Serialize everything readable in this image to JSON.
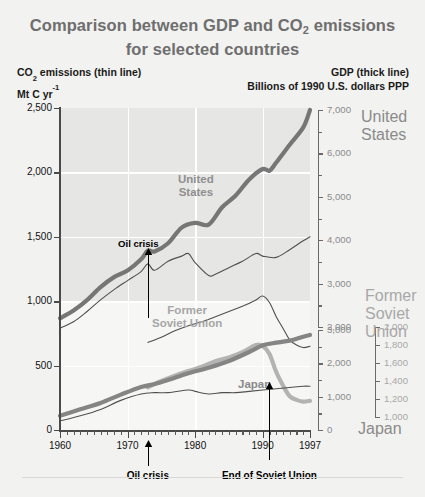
{
  "header": {
    "title_line1": "Comparison between GDP and CO",
    "title_sub": "2",
    "title_line1b": " emissions",
    "title_line2": "for selected countries",
    "left_head_l1a": "CO",
    "left_head_sub": "2",
    "left_head_l1b": " emissions (thin line)",
    "left_head_l2a": "Mt C yr",
    "left_head_l2sup": "-1",
    "right_head_l1": "GDP (thick line)",
    "right_head_l2": "Billions of 1990 U.S. dollars PPP"
  },
  "colors": {
    "title": "#6e6e6e",
    "plot_bg": "#f6f6f4",
    "plot_band": "#e6e6e4",
    "grid": "#ffffff",
    "axis": "#4a4a4a",
    "united_states": "#767676",
    "former_soviet_union": "#b3b3b3",
    "japan": "#858585",
    "thin_line": "#4f4f4f",
    "annotation": "#000000"
  },
  "chart_data": {
    "type": "line",
    "title": "Comparison between GDP and CO2 emissions for selected countries",
    "xlabel": "",
    "ylabel": "CO2 emissions (thin line) Mt C yr-1",
    "ylabel_right": "GDP (thick line) Billions of 1990 U.S. dollars PPP",
    "grid": true,
    "legend_position": "inline-annotations",
    "xlim": [
      1960,
      1997
    ],
    "x_ticks": [
      1960,
      1970,
      1980,
      1990,
      1997
    ],
    "x_minor_tick_interval": 1,
    "ylim_left": [
      0,
      2500
    ],
    "y_ticks_left": [
      0,
      500,
      1000,
      1500,
      2000,
      2500
    ],
    "y_tick_labels_left": [
      "0",
      "500",
      "1,000",
      "1,500",
      "2,000",
      "2,500"
    ],
    "right_axes": [
      {
        "name": "United States",
        "label": "United\nStates",
        "label_lines": [
          "United",
          "States"
        ],
        "ticks": [
          2000,
          3000,
          4000,
          5000,
          6000,
          7000
        ],
        "tick_labels": [
          "2,000",
          "3,000",
          "4,000",
          "5,000",
          "6,000",
          "7,000"
        ],
        "minor_tick_interval": 500,
        "range": [
          2000,
          7000
        ]
      },
      {
        "name": "Former Soviet Union",
        "label_lines": [
          "Former",
          "Soviet",
          "Union"
        ],
        "ticks": [
          1000,
          1200,
          1400,
          1600,
          1800,
          2000
        ],
        "tick_labels": [
          "1,000",
          "1,200",
          "1,400",
          "1,600",
          "1,800",
          "2,000"
        ],
        "range": [
          1000,
          2000
        ]
      },
      {
        "name": "Japan",
        "label_lines": [
          "Japan"
        ],
        "ticks": [
          0,
          1000,
          2000,
          3000
        ],
        "tick_labels": [
          "0",
          "1,000",
          "2,000",
          "3,000"
        ],
        "minor_tick_interval": 500,
        "range": [
          0,
          3000
        ]
      }
    ],
    "series": [
      {
        "name": "United States GDP",
        "country": "United States",
        "kind": "GDP",
        "style": "thick",
        "axis": "us-gdp",
        "unit": "Billions of 1990 U.S. dollars PPP",
        "x": [
          1960,
          1962,
          1964,
          1966,
          1968,
          1970,
          1972,
          1973,
          1974,
          1976,
          1978,
          1980,
          1982,
          1984,
          1986,
          1988,
          1990,
          1991,
          1992,
          1994,
          1996,
          1997
        ],
        "values": [
          2200,
          2380,
          2620,
          2920,
          3150,
          3300,
          3560,
          3760,
          3740,
          3930,
          4290,
          4400,
          4360,
          4760,
          5030,
          5400,
          5640,
          5600,
          5790,
          6200,
          6600,
          7000
        ]
      },
      {
        "name": "United States CO2",
        "country": "United States",
        "kind": "CO2",
        "style": "thin",
        "axis": "left",
        "unit": "Mt C yr-1",
        "x": [
          1960,
          1962,
          1964,
          1966,
          1968,
          1970,
          1972,
          1973,
          1974,
          1976,
          1978,
          1979,
          1980,
          1982,
          1983,
          1985,
          1987,
          1989,
          1990,
          1992,
          1994,
          1996,
          1997
        ],
        "values": [
          790,
          840,
          920,
          1010,
          1090,
          1160,
          1230,
          1290,
          1240,
          1310,
          1350,
          1370,
          1300,
          1200,
          1210,
          1260,
          1310,
          1370,
          1350,
          1340,
          1400,
          1470,
          1500
        ]
      },
      {
        "name": "Former Soviet Union GDP",
        "country": "Former Soviet Union",
        "kind": "GDP",
        "style": "thick",
        "axis": "fsu",
        "unit": "Billions of 1990 U.S. dollars PPP",
        "x": [
          1973,
          1975,
          1977,
          1979,
          1981,
          1983,
          1985,
          1987,
          1989,
          1990,
          1991,
          1992,
          1993,
          1994,
          1995,
          1996,
          1997
        ],
        "values": [
          1330,
          1400,
          1460,
          1510,
          1560,
          1620,
          1660,
          1720,
          1800,
          1790,
          1700,
          1500,
          1350,
          1230,
          1190,
          1170,
          1180
        ]
      },
      {
        "name": "Former Soviet Union CO2",
        "country": "Former Soviet Union",
        "kind": "CO2",
        "style": "thin",
        "axis": "left",
        "unit": "Mt C yr-1",
        "x": [
          1973,
          1975,
          1977,
          1979,
          1981,
          1983,
          1985,
          1987,
          1989,
          1990,
          1991,
          1992,
          1993,
          1994,
          1995,
          1996,
          1997
        ],
        "values": [
          680,
          720,
          770,
          810,
          840,
          880,
          920,
          960,
          1010,
          1040,
          990,
          880,
          790,
          700,
          660,
          640,
          650
        ]
      },
      {
        "name": "Japan GDP",
        "country": "Japan",
        "kind": "GDP",
        "style": "thick",
        "axis": "japan",
        "unit": "Billions of 1990 U.S. dollars PPP",
        "x": [
          1960,
          1963,
          1966,
          1969,
          1972,
          1974,
          1976,
          1979,
          1982,
          1985,
          1988,
          1990,
          1992,
          1994,
          1996,
          1997
        ],
        "values": [
          430,
          620,
          810,
          1060,
          1290,
          1380,
          1500,
          1700,
          1870,
          2070,
          2340,
          2540,
          2620,
          2680,
          2800,
          2850
        ]
      },
      {
        "name": "Japan CO2",
        "country": "Japan",
        "kind": "CO2",
        "style": "thin",
        "axis": "left",
        "unit": "Mt C yr-1",
        "x": [
          1960,
          1963,
          1966,
          1969,
          1972,
          1974,
          1976,
          1979,
          1980,
          1982,
          1984,
          1986,
          1988,
          1990,
          1992,
          1994,
          1996,
          1997
        ],
        "values": [
          70,
          110,
          160,
          230,
          280,
          290,
          290,
          310,
          300,
          280,
          290,
          290,
          300,
          310,
          320,
          330,
          340,
          340
        ]
      }
    ],
    "annotations": [
      {
        "label": "Oil crisis",
        "x": 1973,
        "placement": "in-plot",
        "has_arrow": true
      },
      {
        "label": "Oil crisis",
        "x": 1973,
        "placement": "below-axis",
        "has_arrow": true
      },
      {
        "label": "End of Soviet Union",
        "x": 1991,
        "placement": "below-axis",
        "has_arrow": true
      }
    ],
    "inplot_labels": [
      {
        "text_lines": [
          "United",
          "States"
        ],
        "series": "United States"
      },
      {
        "text_lines": [
          "Former",
          "Soviet Union"
        ],
        "series": "Former Soviet Union"
      },
      {
        "text_lines": [
          "Japan"
        ],
        "series": "Japan"
      }
    ]
  }
}
